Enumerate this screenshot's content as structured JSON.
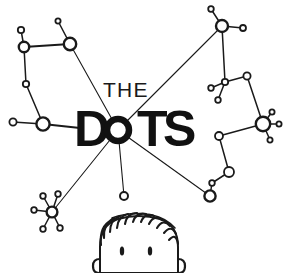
{
  "artwork": {
    "title": "The Dots",
    "kind": "hand-drawn connect-the-dots constellation logo",
    "background_color": "#ffffff",
    "ink_color": "#1a1a1a"
  },
  "wordmark": {
    "line1": "THE",
    "line2_letters": [
      "D",
      "O",
      "T",
      "S"
    ],
    "line2": "DOTS",
    "line1_color": "#1a1a1a",
    "line2_color": "#111111"
  },
  "hub": {
    "label": "central-hub-o",
    "cx": 118,
    "cy": 130,
    "r": 11
  },
  "constellations": [
    {
      "name": "upper-left-constellation",
      "nodes": [
        {
          "id": "ul-a",
          "cx": 21,
          "cy": 30,
          "r": 3.2
        },
        {
          "id": "ul-b",
          "cx": 24,
          "cy": 47,
          "r": 5.2
        },
        {
          "id": "ul-c",
          "cx": 58,
          "cy": 21,
          "r": 2.6
        },
        {
          "id": "ul-d",
          "cx": 70,
          "cy": 44,
          "r": 6.2
        },
        {
          "id": "ul-e",
          "cx": 26,
          "cy": 84,
          "r": 3.2
        },
        {
          "id": "ul-f",
          "cx": 43,
          "cy": 124,
          "r": 6.6
        },
        {
          "id": "ul-g",
          "cx": 13,
          "cy": 122,
          "r": 3.6
        }
      ],
      "edges": [
        [
          "ul-a",
          "ul-b"
        ],
        [
          "ul-b",
          "ul-d"
        ],
        [
          "ul-c",
          "ul-d"
        ],
        [
          "ul-b",
          "ul-e"
        ],
        [
          "ul-e",
          "ul-f"
        ],
        [
          "ul-g",
          "ul-f"
        ]
      ]
    },
    {
      "name": "upper-right-constellation",
      "nodes": [
        {
          "id": "ur-a",
          "cx": 211,
          "cy": 9,
          "r": 2.8
        },
        {
          "id": "ur-b",
          "cx": 222,
          "cy": 26,
          "r": 6.0
        },
        {
          "id": "ur-c",
          "cx": 243,
          "cy": 28,
          "r": 3.0
        },
        {
          "id": "ur-d",
          "cx": 225,
          "cy": 82,
          "r": 3.2
        },
        {
          "id": "ur-e",
          "cx": 211,
          "cy": 88,
          "r": 2.8
        },
        {
          "id": "ur-f",
          "cx": 218,
          "cy": 100,
          "r": 2.8
        },
        {
          "id": "ur-g",
          "cx": 247,
          "cy": 76,
          "r": 3.6
        },
        {
          "id": "ur-h",
          "cx": 263,
          "cy": 124,
          "r": 7.2
        },
        {
          "id": "ur-i",
          "cx": 272,
          "cy": 112,
          "r": 2.6
        },
        {
          "id": "ur-j",
          "cx": 279,
          "cy": 124,
          "r": 2.6
        },
        {
          "id": "ur-k",
          "cx": 270,
          "cy": 140,
          "r": 2.6
        },
        {
          "id": "ur-l",
          "cx": 219,
          "cy": 136,
          "r": 4.0
        },
        {
          "id": "ur-m",
          "cx": 229,
          "cy": 172,
          "r": 5.0
        },
        {
          "id": "ur-n",
          "cx": 212,
          "cy": 183,
          "r": 2.8
        },
        {
          "id": "ur-o",
          "cx": 210,
          "cy": 196,
          "r": 5.6
        }
      ],
      "edges": [
        [
          "ur-a",
          "ur-b"
        ],
        [
          "ur-b",
          "ur-c"
        ],
        [
          "ur-b",
          "ur-d"
        ],
        [
          "ur-d",
          "ur-e"
        ],
        [
          "ur-d",
          "ur-f"
        ],
        [
          "ur-d",
          "ur-g"
        ],
        [
          "ur-g",
          "ur-h"
        ],
        [
          "ur-h",
          "ur-i"
        ],
        [
          "ur-h",
          "ur-j"
        ],
        [
          "ur-h",
          "ur-k"
        ],
        [
          "ur-h",
          "ur-l"
        ],
        [
          "ur-l",
          "ur-m"
        ],
        [
          "ur-m",
          "ur-n"
        ],
        [
          "ur-n",
          "ur-o"
        ]
      ]
    },
    {
      "name": "lower-left-burst",
      "nodes": [
        {
          "id": "ll-hub",
          "cx": 52,
          "cy": 212,
          "r": 5.4
        },
        {
          "id": "ll-a",
          "cx": 43,
          "cy": 196,
          "r": 2.8
        },
        {
          "id": "ll-b",
          "cx": 58,
          "cy": 194,
          "r": 2.8
        },
        {
          "id": "ll-c",
          "cx": 34,
          "cy": 210,
          "r": 2.8
        },
        {
          "id": "ll-d",
          "cx": 43,
          "cy": 229,
          "r": 2.8
        },
        {
          "id": "ll-e",
          "cx": 60,
          "cy": 228,
          "r": 2.8
        }
      ],
      "edges": [
        [
          "ll-hub",
          "ll-a"
        ],
        [
          "ll-hub",
          "ll-b"
        ],
        [
          "ll-hub",
          "ll-c"
        ],
        [
          "ll-hub",
          "ll-d"
        ],
        [
          "ll-hub",
          "ll-e"
        ]
      ]
    }
  ],
  "hub_rays": [
    {
      "id": "ray-to-upper-left",
      "to_x": 70,
      "to_y": 44
    },
    {
      "id": "ray-to-upper-right",
      "to_x": 222,
      "to_y": 26
    },
    {
      "id": "ray-to-right",
      "to_x": 210,
      "to_y": 196
    },
    {
      "id": "ray-to-lower-left",
      "to_x": 52,
      "to_y": 212
    },
    {
      "id": "ray-to-lower-dot",
      "to_x": 124,
      "to_y": 196
    }
  ],
  "lone_node": {
    "id": "lower-center-dot",
    "cx": 124,
    "cy": 196,
    "r": 4.0
  },
  "left_hub_line": {
    "from_x": 43,
    "from_y": 124,
    "to_x": 80,
    "to_y": 128
  },
  "character": {
    "name": "peeking-head",
    "hair_style": "spiky",
    "eye_count": 2,
    "ear_count": 2
  }
}
